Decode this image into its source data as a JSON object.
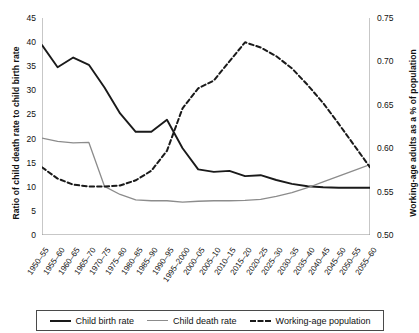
{
  "chart_data": {
    "type": "line",
    "title": "",
    "xlabel": "",
    "ylabel": "Ratio of child death rate to child birth rate",
    "ylabel_right": "Working-age adults as a % of population",
    "ylim": [
      0,
      45
    ],
    "yticks": [
      "0",
      "5",
      "10",
      "15",
      "20",
      "25",
      "30",
      "35",
      "40",
      "45"
    ],
    "ylim_right": [
      0.5,
      0.75
    ],
    "yticks_right": [
      "0.50",
      "0.55",
      "0.60",
      "0.65",
      "0.70",
      "0.75"
    ],
    "grid": false,
    "legend_position": "bottom",
    "categories": [
      "1950–55",
      "1955–60",
      "1960–65",
      "1965–70",
      "1970–75",
      "1975–80",
      "1980–85",
      "1985–90",
      "1990–95",
      "1995–2000",
      "2000–05",
      "2005–10",
      "2010–15",
      "2015–20",
      "2020–25",
      "2025–30",
      "2030–35",
      "2035–40",
      "2040–45",
      "2045–50",
      "2050–55",
      "2055–60"
    ],
    "series": [
      {
        "name": "Child birth rate",
        "axis": "left",
        "style": "solid",
        "color": "#1a1a1a",
        "values": [
          39.4,
          34.8,
          36.8,
          35.3,
          30.6,
          25.2,
          21.4,
          21.4,
          23.9,
          18.0,
          13.6,
          13.1,
          13.3,
          12.2,
          12.4,
          11.4,
          10.6,
          10.1,
          9.9,
          9.8,
          9.8,
          9.8
        ]
      },
      {
        "name": "Child death rate",
        "axis": "left",
        "style": "solid",
        "color": "#8c8c8c",
        "values": [
          20.1,
          19.4,
          19.1,
          19.2,
          10.1,
          8.4,
          7.3,
          7.1,
          7.1,
          6.8,
          7.0,
          7.1,
          7.1,
          7.2,
          7.4,
          8.0,
          8.8,
          9.8,
          11.0,
          12.2,
          13.4,
          14.6
        ]
      },
      {
        "name": "Working-age population",
        "axis": "right",
        "style": "dashed",
        "color": "#1a1a1a",
        "values": [
          0.578,
          0.565,
          0.558,
          0.556,
          0.556,
          0.557,
          0.563,
          0.574,
          0.597,
          0.646,
          0.669,
          0.678,
          0.7,
          0.722,
          0.716,
          0.706,
          0.692,
          0.673,
          0.652,
          0.628,
          0.603,
          0.578
        ]
      }
    ]
  },
  "legend": {
    "items": [
      {
        "label": "Child birth rate",
        "swatch": "solid-dark"
      },
      {
        "label": "Child death rate",
        "swatch": "solid-gray"
      },
      {
        "label": "Working-age population",
        "swatch": "dashed"
      }
    ]
  }
}
